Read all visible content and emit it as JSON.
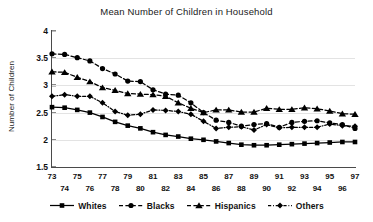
{
  "chart_data": {
    "type": "line",
    "title": "Mean Number of Children in Household",
    "xlabel": "",
    "ylabel": "Number of Children",
    "ylim": [
      1.5,
      4
    ],
    "yticks": [
      1.5,
      2,
      2.5,
      3,
      3.5,
      4
    ],
    "ytick_labels": [
      "1.5",
      "2",
      "2.5",
      "3",
      "3.5",
      "4"
    ],
    "grid": "horizontal",
    "legend_position": "bottom",
    "x": [
      73,
      74,
      75,
      76,
      77,
      78,
      79,
      80,
      81,
      82,
      83,
      84,
      85,
      86,
      87,
      88,
      89,
      90,
      91,
      92,
      93,
      94,
      95,
      96,
      97
    ],
    "xtick_labels_row_top": [
      "73",
      "75",
      "77",
      "79",
      "81",
      "83",
      "85",
      "87",
      "89",
      "91",
      "93",
      "95",
      "97"
    ],
    "xtick_labels_row_bottom": [
      "74",
      "76",
      "78",
      "80",
      "82",
      "84",
      "86",
      "88",
      "90",
      "92",
      "94",
      "96"
    ],
    "series": [
      {
        "name": "Whites",
        "marker": "square",
        "line_style": "solid",
        "color": "#000000",
        "values": [
          2.6,
          2.59,
          2.55,
          2.5,
          2.42,
          2.33,
          2.26,
          2.21,
          2.14,
          2.09,
          2.06,
          2.02,
          2.0,
          1.97,
          1.94,
          1.91,
          1.9,
          1.9,
          1.91,
          1.92,
          1.93,
          1.94,
          1.95,
          1.96,
          1.96
        ]
      },
      {
        "name": "Blacks",
        "marker": "circle",
        "line_style": "dashed",
        "color": "#000000",
        "values": [
          3.58,
          3.57,
          3.51,
          3.45,
          3.31,
          3.21,
          3.08,
          3.07,
          2.92,
          2.84,
          2.82,
          2.68,
          2.5,
          2.36,
          2.32,
          2.25,
          2.28,
          2.3,
          2.23,
          2.32,
          2.34,
          2.35,
          2.31,
          2.28,
          2.21
        ]
      },
      {
        "name": "Hispanics",
        "marker": "triangle",
        "line_style": "dashed",
        "color": "#000000",
        "values": [
          3.25,
          3.24,
          3.15,
          3.07,
          2.96,
          2.91,
          2.85,
          2.84,
          2.83,
          2.8,
          2.68,
          2.58,
          2.5,
          2.55,
          2.55,
          2.51,
          2.51,
          2.58,
          2.56,
          2.56,
          2.59,
          2.57,
          2.53,
          2.48,
          2.47
        ]
      },
      {
        "name": "Others",
        "marker": "diamond",
        "line_style": "dashdot",
        "color": "#000000",
        "values": [
          2.8,
          2.83,
          2.8,
          2.8,
          2.68,
          2.52,
          2.45,
          2.47,
          2.55,
          2.54,
          2.52,
          2.47,
          2.34,
          2.21,
          2.23,
          2.24,
          2.18,
          2.28,
          2.22,
          2.23,
          2.23,
          2.23,
          2.29,
          2.26,
          2.25
        ]
      }
    ]
  },
  "legend": {
    "items": [
      {
        "label": "Whites"
      },
      {
        "label": "Blacks"
      },
      {
        "label": "Hispanics"
      },
      {
        "label": "Others"
      }
    ]
  }
}
